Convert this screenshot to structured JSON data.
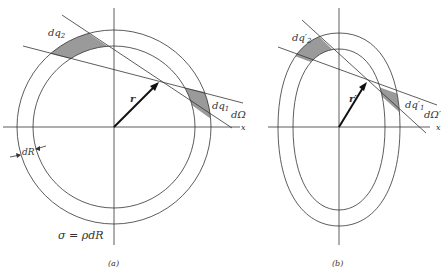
{
  "panel_a": {
    "caption": "(a)",
    "label_dq2": "dq",
    "label_dq2_sub": "2",
    "label_dq1": "dq",
    "label_dq1_sub": "1",
    "label_dOmega": "dΩ",
    "label_r": "r",
    "label_x": "x",
    "label_dR": "dR",
    "label_sigma": "σ = ρdR"
  },
  "panel_b": {
    "caption": "(b)",
    "label_dq2": "dq′",
    "label_dq2_sub": "2",
    "label_dq1": "dq′",
    "label_dq1_sub": "1",
    "label_dOmega": "dΩ′",
    "label_r": "r′",
    "label_x": "x"
  },
  "colors": {
    "line": "#333333",
    "shade": "#999999"
  }
}
